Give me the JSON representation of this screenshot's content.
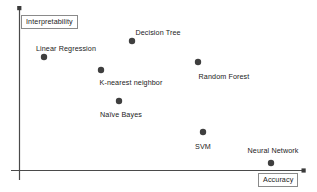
{
  "chart_data": {
    "type": "scatter",
    "title": "",
    "xlabel": "Accuracy",
    "ylabel": "Interpretability",
    "xlim": [
      0,
      100
    ],
    "ylim": [
      0,
      100
    ],
    "grid": false,
    "legend": "none",
    "axes": {
      "x_axis_arrow": true,
      "y_axis_arrow": true,
      "tick_labels_x": [],
      "tick_labels_y": []
    },
    "point_color": "#3f3f3f",
    "points": [
      {
        "name": "Linear Regression",
        "label": "Linear Regression",
        "x": 10,
        "y": 70,
        "px": 44,
        "py": 57,
        "label_px": 66,
        "label_py": 44,
        "label_position": "above"
      },
      {
        "name": "Decision Tree",
        "label": "Decision Tree",
        "x": 40,
        "y": 80,
        "px": 132,
        "py": 41,
        "label_px": 158,
        "label_py": 28,
        "label_position": "above"
      },
      {
        "name": "K-nearest neighbor",
        "label": "K-nearest neighbor",
        "x": 29,
        "y": 62,
        "px": 101,
        "py": 70,
        "label_px": 131,
        "label_py": 78,
        "label_position": "below"
      },
      {
        "name": "Random Forest",
        "label": "Random Forest",
        "x": 63,
        "y": 66,
        "px": 198,
        "py": 62,
        "label_px": 224,
        "label_py": 72,
        "label_position": "below"
      },
      {
        "name": "Naive Bayes",
        "label": "Naïve Bayes",
        "x": 35,
        "y": 44,
        "px": 119,
        "py": 101,
        "label_px": 121,
        "label_py": 110,
        "label_position": "below"
      },
      {
        "name": "SVM",
        "label": "SVM",
        "x": 65,
        "y": 25,
        "px": 203,
        "py": 132,
        "label_px": 203,
        "label_py": 142,
        "label_position": "below"
      },
      {
        "name": "Neural Network",
        "label": "Neural Network",
        "x": 89,
        "y": 5,
        "px": 271,
        "py": 163,
        "label_px": 273,
        "label_py": 146,
        "label_position": "above"
      }
    ]
  },
  "axis_titles": {
    "y": "Interpretability",
    "x": "Accuracy"
  }
}
